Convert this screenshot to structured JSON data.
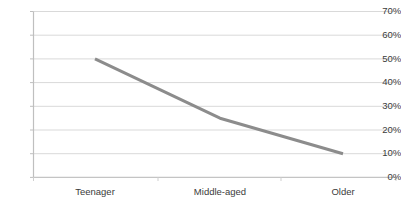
{
  "chart_data": {
    "type": "line",
    "title": "",
    "subtitle": "",
    "xlabel": "",
    "ylabel": "",
    "categories": [
      "Teenager",
      "Middle-aged",
      "Older"
    ],
    "values": [
      50,
      25,
      10
    ],
    "series": [
      {
        "name": "",
        "values": [
          50,
          25,
          10
        ],
        "color": "#8c8c8c"
      }
    ],
    "ylim": [
      0,
      70
    ],
    "ytick_values": [
      0,
      10,
      20,
      30,
      40,
      50,
      60,
      70
    ],
    "ytick_labels": [
      "0%",
      "10%",
      "20%",
      "30%",
      "40%",
      "50%",
      "60%",
      "70%"
    ],
    "ytick_step": 10,
    "grid": true,
    "grid_axis": "y",
    "grid_color": "#d9d9d9",
    "axis_color": "#bfbfbf",
    "legend": false,
    "legend_position": "none",
    "markers": false,
    "line_width": 3,
    "background_color": "#ffffff",
    "annotations": []
  }
}
